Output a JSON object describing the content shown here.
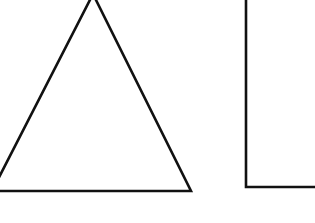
{
  "canvas": {
    "width": 315,
    "height": 223,
    "background_color": "#ffffff",
    "description": "Two black line-drawn geometric figures on a plain white background"
  },
  "style": {
    "stroke_color": "#111111",
    "stroke_width": 2.6,
    "fill": "none"
  },
  "shapes": [
    {
      "id": "triangle",
      "name": "triangle-shape",
      "type": "polyline",
      "label": "Triangle",
      "closed": true,
      "clipped_edges": [
        "top",
        "left"
      ],
      "points": [
        {
          "x": 93,
          "y": -6
        },
        {
          "x": -8,
          "y": 191
        },
        {
          "x": 191,
          "y": 191
        }
      ],
      "apex": {
        "x": 93,
        "y": -6
      },
      "bottom_left": {
        "x": -8,
        "y": 191
      },
      "bottom_right": {
        "x": 191,
        "y": 191
      },
      "baseline_y": 191
    },
    {
      "id": "right-angle",
      "name": "right-angle-shape",
      "type": "polyline",
      "label": "Right angle corner",
      "closed": false,
      "clipped_edges": [
        "top",
        "right"
      ],
      "points": [
        {
          "x": 246,
          "y": -6
        },
        {
          "x": 246,
          "y": 187
        },
        {
          "x": 322,
          "y": 187
        }
      ],
      "corner": {
        "x": 246,
        "y": 187
      },
      "vertical_x": 246,
      "horizontal_y": 187
    }
  ]
}
